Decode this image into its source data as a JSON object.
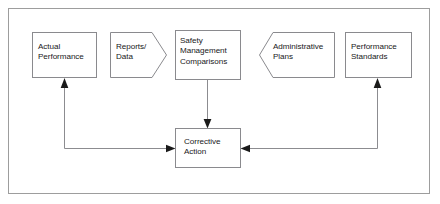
{
  "diagram": {
    "type": "flowchart",
    "frame": {
      "border_color": "#9a9a9a",
      "background": "#ffffff",
      "x": 8,
      "y": 8,
      "width": 422,
      "height": 186
    },
    "style": {
      "line_color": "#8c8c90",
      "shape_stroke": "#8a8a8e",
      "shape_fill": "#ffffff",
      "arrowhead_color": "#1a1a1a",
      "text_color": "#18181a"
    },
    "nodes": [
      {
        "id": "actual-performance",
        "label": "Actual\nPerformance",
        "shape": "rectangle",
        "x": 32,
        "y": 32,
        "width": 65,
        "height": 46,
        "text_x": 38,
        "text_y": 42
      },
      {
        "id": "reports-data",
        "label": "Reports/\nData",
        "shape": "pentagon-right",
        "x": 110,
        "y": 32,
        "width": 57,
        "height": 46,
        "text_x": 116,
        "text_y": 42
      },
      {
        "id": "safety-management-comparisons",
        "label": "Safety\nManagement\nComparisons",
        "shape": "rectangle",
        "x": 175,
        "y": 30,
        "width": 66,
        "height": 50,
        "text_x": 180,
        "text_y": 36
      },
      {
        "id": "administrative-plans",
        "label": "Administrative\nPlans",
        "shape": "pentagon-left",
        "x": 259,
        "y": 32,
        "width": 76,
        "height": 46,
        "text_x": 273,
        "text_y": 42
      },
      {
        "id": "performance-standards",
        "label": "Performance\nStandards",
        "shape": "rectangle",
        "x": 345,
        "y": 32,
        "width": 67,
        "height": 46,
        "text_x": 351,
        "text_y": 42
      },
      {
        "id": "corrective-action",
        "label": "Corrective\nAction",
        "shape": "rectangle",
        "x": 175,
        "y": 128,
        "width": 66,
        "height": 40,
        "text_x": 184,
        "text_y": 137
      }
    ],
    "connectors": [
      {
        "id": "safety-to-corrective",
        "from": "safety-management-comparisons",
        "to": "corrective-action",
        "direction": "down",
        "path": "M 207.5 80 L 207.5 126",
        "arrow_at": {
          "x": 207.5,
          "y": 128,
          "angle": 90
        }
      },
      {
        "id": "corrective-to-actual-performance",
        "from": "corrective-action",
        "to": "actual-performance",
        "direction": "left-up-feedback",
        "path": "M 173 148 L 64.5 148 L 64.5 81",
        "arrow_at": {
          "x": 64.5,
          "y": 78,
          "angle": 270
        }
      },
      {
        "id": "corrective-action-inflow-left",
        "from": "feedback-loop-left",
        "to": "corrective-action",
        "direction": "right",
        "path": "M 64.5 148 L 173 148",
        "arrow_at": {
          "x": 175,
          "y": 148,
          "angle": 0
        }
      },
      {
        "id": "performance-standards-to-corrective",
        "from": "performance-standards",
        "to": "corrective-action",
        "direction": "down-left-feedback",
        "path": "M 377.5 81 L 377.5 148 L 243 148",
        "arrow_at": {
          "x": 241,
          "y": 148,
          "angle": 180
        }
      },
      {
        "id": "corrective-to-performance-standards",
        "from": "corrective-action",
        "to": "performance-standards",
        "direction": "up",
        "path": "M 377.5 148 L 377.5 81",
        "arrow_at": {
          "x": 377.5,
          "y": 78,
          "angle": 270
        }
      }
    ]
  }
}
